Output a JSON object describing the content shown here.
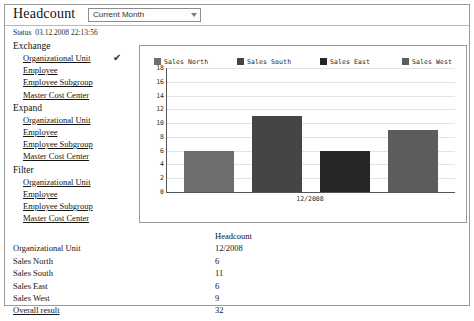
{
  "header": {
    "title": "Headcount",
    "period_selector": {
      "value": "Current Month",
      "arrow_icon": "chevron-down-icon"
    }
  },
  "status": {
    "label": "Status",
    "timestamp": "03.12.2008 22:13:56"
  },
  "nav": {
    "groups": [
      {
        "title": "Exchange",
        "items": [
          {
            "label": "Organizational Unit",
            "checked": true,
            "check_glyph": "✔"
          },
          {
            "label": "Employee",
            "checked": false
          },
          {
            "label": "Employee Subgroup",
            "checked": false
          },
          {
            "label": "Master Cost Center",
            "checked": false
          }
        ]
      },
      {
        "title": "Expand",
        "items": [
          {
            "label": "Organizational Unit",
            "checked": false
          },
          {
            "label": "Employee",
            "checked": false
          },
          {
            "label": "Employee Subgroup",
            "checked": false
          },
          {
            "label": "Master Cost Center",
            "checked": false
          }
        ]
      },
      {
        "title": "Filter",
        "items": [
          {
            "label": "Organizational Unit",
            "checked": false
          },
          {
            "label": "Employee",
            "checked": false
          },
          {
            "label": "Employee Subgroup",
            "checked": false
          },
          {
            "label": "Master Cost Center",
            "checked": false
          }
        ]
      }
    ]
  },
  "chart_data": {
    "type": "bar",
    "title": "",
    "xlabel": "",
    "ylabel": "",
    "categories": [
      "12/2008"
    ],
    "x_tick_labels": [
      "12/2008"
    ],
    "y_tick_labels": [
      "0",
      "2",
      "4",
      "6",
      "8",
      "10",
      "12",
      "14",
      "16",
      "18"
    ],
    "ylim": [
      0,
      18
    ],
    "ystep": 2,
    "grid": true,
    "legend_position": "top",
    "series": [
      {
        "name": "Sales North",
        "values": [
          6
        ],
        "color": "#6e6e6e"
      },
      {
        "name": "Sales South",
        "values": [
          11
        ],
        "color": "#454545"
      },
      {
        "name": "Sales East",
        "values": [
          6
        ],
        "color": "#262626"
      },
      {
        "name": "Sales West",
        "values": [
          9
        ],
        "color": "#5c5c5c"
      }
    ]
  },
  "table": {
    "header": {
      "label": "",
      "value": "Headcount"
    },
    "rows": [
      {
        "label": "Organizational Unit",
        "value": "12/2008"
      },
      {
        "label": "Sales North",
        "value": "6"
      },
      {
        "label": "Sales South",
        "value": "11"
      },
      {
        "label": "Sales East",
        "value": "6"
      },
      {
        "label": "Sales West",
        "value": "9"
      },
      {
        "label": "Overall result",
        "value": "32"
      }
    ]
  }
}
